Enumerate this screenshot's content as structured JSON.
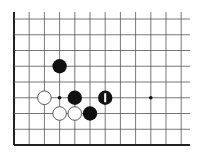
{
  "board": {
    "description": "Partial Go board diagram, bottom-left corner",
    "grid": {
      "x0": 14,
      "dx": 15.2,
      "cols": 12,
      "y0": 19,
      "dy": 15.75,
      "rows": 9,
      "extend_right_to": 190,
      "extend_top_to": 12,
      "line_color": "#555555",
      "edge_color": "#222222"
    },
    "edges": {
      "left": true,
      "bottom": true,
      "top": false,
      "right": false
    },
    "star_points": [
      {
        "col": 3,
        "row": 5
      },
      {
        "col": 9,
        "row": 5
      }
    ],
    "stones": [
      {
        "color": "black",
        "col": 3,
        "row": 3
      },
      {
        "color": "white",
        "col": 2,
        "row": 5
      },
      {
        "color": "black",
        "col": 4,
        "row": 5
      },
      {
        "color": "black",
        "col": 6,
        "row": 5,
        "marker": "last-move-bar"
      },
      {
        "color": "white",
        "col": 3,
        "row": 6
      },
      {
        "color": "white",
        "col": 4,
        "row": 6
      },
      {
        "color": "black",
        "col": 5,
        "row": 6
      }
    ],
    "colors": {
      "black_stone": "#111111",
      "white_stone": "#ffffff",
      "white_stone_outline": "#333333",
      "marker": "#ffffff"
    }
  }
}
